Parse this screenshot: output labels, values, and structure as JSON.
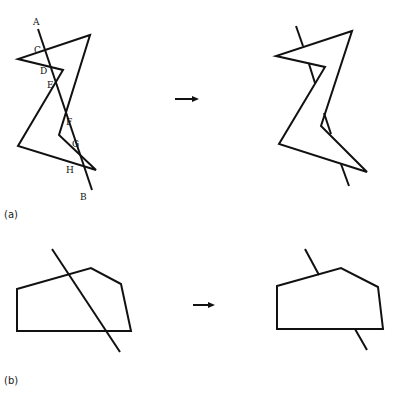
{
  "colors": {
    "stroke": "#111111",
    "background": "#ffffff"
  },
  "panel_a": {
    "caption": "(a)",
    "before": {
      "polygon": [
        [
          90,
          35
        ],
        [
          18,
          59
        ],
        [
          63,
          70
        ],
        [
          18,
          146
        ],
        [
          96,
          170
        ],
        [
          59,
          135
        ]
      ],
      "line": {
        "from": [
          38,
          29
        ],
        "to": [
          92,
          190
        ]
      },
      "points": [
        {
          "label": "A",
          "x": 33,
          "y": 25
        },
        {
          "label": "C",
          "x": 34,
          "y": 53
        },
        {
          "label": "D",
          "x": 40,
          "y": 74
        },
        {
          "label": "E",
          "x": 47,
          "y": 88
        },
        {
          "label": "F",
          "x": 66,
          "y": 125
        },
        {
          "label": "G",
          "x": 72,
          "y": 147
        },
        {
          "label": "H",
          "x": 66,
          "y": 173
        },
        {
          "label": "B",
          "x": 80,
          "y": 200
        }
      ]
    },
    "arrow": {
      "from": [
        175,
        99
      ],
      "to": [
        199,
        99
      ]
    },
    "after": {
      "polygon": [
        [
          352,
          31
        ],
        [
          276,
          56
        ],
        [
          325,
          67
        ],
        [
          279,
          144
        ],
        [
          367,
          172
        ],
        [
          321,
          126
        ]
      ],
      "segments": [
        [
          [
            296,
            26
          ],
          [
            303,
            46
          ]
        ],
        [
          [
            309,
            64
          ],
          [
            315,
            83
          ]
        ],
        [
          [
            324,
            113
          ],
          [
            331,
            134
          ]
        ],
        [
          [
            341,
            164
          ],
          [
            349,
            186
          ]
        ]
      ]
    }
  },
  "panel_b": {
    "caption": "(b)",
    "before": {
      "polygon": [
        [
          17,
          289
        ],
        [
          91,
          268
        ],
        [
          121,
          284
        ],
        [
          131,
          331
        ],
        [
          17,
          331
        ]
      ],
      "line": {
        "from": [
          52,
          249
        ],
        "to": [
          120,
          352
        ]
      }
    },
    "arrow": {
      "from": [
        193,
        305
      ],
      "to": [
        215,
        305
      ]
    },
    "after": {
      "polygon": [
        [
          277,
          286
        ],
        [
          341,
          268
        ],
        [
          378,
          287
        ],
        [
          383,
          329
        ],
        [
          277,
          329
        ]
      ],
      "segments": [
        [
          [
            305,
            249
          ],
          [
            319,
            275
          ]
        ],
        [
          [
            355,
            329
          ],
          [
            367,
            350
          ]
        ]
      ]
    }
  }
}
